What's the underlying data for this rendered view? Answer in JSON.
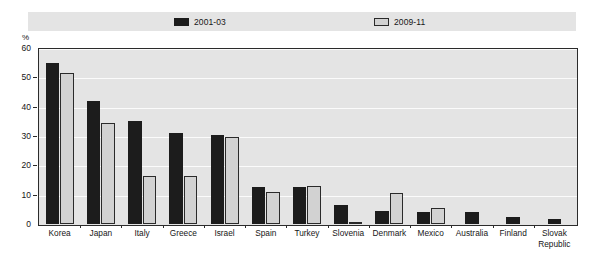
{
  "chart_data": {
    "type": "bar",
    "title": "",
    "subtitle": "",
    "xlabel": "",
    "ylabel": "%",
    "ylim": [
      0,
      60
    ],
    "yticks": [
      0,
      10,
      20,
      30,
      40,
      50,
      60
    ],
    "ytick_labels": [
      "0",
      "10",
      "20",
      "30",
      "40",
      "50",
      "60"
    ],
    "grid": true,
    "legend_position": "top",
    "categories": [
      "Korea",
      "Japan",
      "Italy",
      "Greece",
      "Israel",
      "Spain",
      "Turkey",
      "Slovenia",
      "Denmark",
      "Mexico",
      "Australia",
      "Finland",
      "Slovak\nRepublic"
    ],
    "series": [
      {
        "name": "2001-03",
        "color": "#1c1c1c",
        "values": [
          55.0,
          42.0,
          35.0,
          31.0,
          30.5,
          12.5,
          12.5,
          6.5,
          4.5,
          4.0,
          4.0,
          2.3,
          1.8
        ]
      },
      {
        "name": "2009-11",
        "color": "#d2d2d2",
        "values": [
          51.5,
          34.5,
          16.5,
          16.5,
          29.5,
          11.0,
          13.0,
          0.5,
          10.5,
          5.5,
          null,
          null,
          null
        ]
      }
    ]
  },
  "legend": {
    "entries": [
      {
        "label": "2001-03",
        "swatch": "dark-square-swatch"
      },
      {
        "label": "2009-11",
        "swatch": "light-square-swatch"
      }
    ]
  },
  "axis": {
    "y_unit_label": "%"
  },
  "colors": {
    "series_2001_03": "#1c1c1c",
    "series_2009_11": "#d2d2d2",
    "plot_background": "#e4e4e4",
    "legend_background": "#e4e4e4",
    "gridline": "#fbfbfb",
    "frame_border": "#2b2b2b",
    "page_background": "#ffffff"
  }
}
